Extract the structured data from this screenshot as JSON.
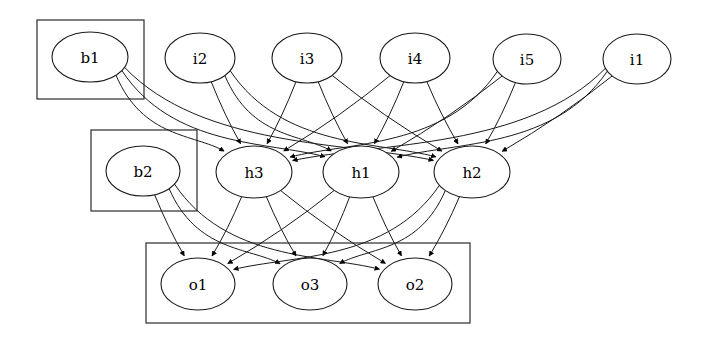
{
  "diagram": {
    "background_color": "#ffffff",
    "stroke_color": "#1a1a1a",
    "label_color": "#000000",
    "width": 711,
    "height": 342
  },
  "clusters": [
    {
      "id": "cluster_b1",
      "label": "",
      "x": 37,
      "y": 20,
      "w": 107,
      "h": 79
    },
    {
      "id": "cluster_b2",
      "label": "",
      "x": 91,
      "y": 130,
      "w": 106,
      "h": 81
    },
    {
      "id": "cluster_out",
      "label": "",
      "x": 146,
      "y": 243,
      "w": 324,
      "h": 80
    }
  ],
  "nodes": [
    {
      "id": "b1",
      "label": "b1",
      "cx": 90,
      "cy": 57,
      "rx": 38,
      "ry": 25,
      "layer": "bias-input"
    },
    {
      "id": "i2",
      "label": "i2",
      "cx": 200,
      "cy": 58,
      "rx": 35,
      "ry": 25,
      "layer": "input"
    },
    {
      "id": "i3",
      "label": "i3",
      "cx": 307,
      "cy": 58,
      "rx": 35,
      "ry": 25,
      "layer": "input"
    },
    {
      "id": "i4",
      "label": "i4",
      "cx": 415,
      "cy": 58,
      "rx": 35,
      "ry": 25,
      "layer": "input"
    },
    {
      "id": "i5",
      "label": "i5",
      "cx": 527,
      "cy": 59,
      "rx": 34,
      "ry": 25,
      "layer": "input"
    },
    {
      "id": "i1",
      "label": "i1",
      "cx": 637,
      "cy": 59,
      "rx": 34,
      "ry": 25,
      "layer": "input"
    },
    {
      "id": "b2",
      "label": "b2",
      "cx": 143,
      "cy": 171,
      "rx": 37,
      "ry": 25,
      "layer": "bias-hidden"
    },
    {
      "id": "h3",
      "label": "h3",
      "cx": 254,
      "cy": 172,
      "rx": 38,
      "ry": 26,
      "layer": "hidden"
    },
    {
      "id": "h1",
      "label": "h1",
      "cx": 361,
      "cy": 172,
      "rx": 38,
      "ry": 26,
      "layer": "hidden"
    },
    {
      "id": "h2",
      "label": "h2",
      "cx": 472,
      "cy": 172,
      "rx": 38,
      "ry": 26,
      "layer": "hidden"
    },
    {
      "id": "o1",
      "label": "o1",
      "cx": 198,
      "cy": 284,
      "rx": 37,
      "ry": 26,
      "layer": "output"
    },
    {
      "id": "o3",
      "label": "o3",
      "cx": 310,
      "cy": 284,
      "rx": 37,
      "ry": 26,
      "layer": "output"
    },
    {
      "id": "o2",
      "label": "o2",
      "cx": 415,
      "cy": 284,
      "rx": 37,
      "ry": 26,
      "layer": "output"
    }
  ],
  "edges": [
    {
      "from": "b1",
      "to": "h3",
      "curved": true
    },
    {
      "from": "b1",
      "to": "h1",
      "curved": true
    },
    {
      "from": "b1",
      "to": "h2",
      "curved": true
    },
    {
      "from": "i2",
      "to": "h3",
      "curved": false
    },
    {
      "from": "i2",
      "to": "h1",
      "curved": true
    },
    {
      "from": "i2",
      "to": "h2",
      "curved": true
    },
    {
      "from": "i3",
      "to": "h3",
      "curved": false
    },
    {
      "from": "i3",
      "to": "h1",
      "curved": false
    },
    {
      "from": "i3",
      "to": "h2",
      "curved": false
    },
    {
      "from": "i4",
      "to": "h3",
      "curved": false
    },
    {
      "from": "i4",
      "to": "h1",
      "curved": false
    },
    {
      "from": "i4",
      "to": "h2",
      "curved": false
    },
    {
      "from": "i5",
      "to": "h3",
      "curved": true
    },
    {
      "from": "i5",
      "to": "h1",
      "curved": false
    },
    {
      "from": "i5",
      "to": "h2",
      "curved": false
    },
    {
      "from": "i1",
      "to": "h3",
      "curved": true
    },
    {
      "from": "i1",
      "to": "h1",
      "curved": true
    },
    {
      "from": "i1",
      "to": "h2",
      "curved": false
    },
    {
      "from": "b2",
      "to": "o1",
      "curved": false
    },
    {
      "from": "b2",
      "to": "o3",
      "curved": true
    },
    {
      "from": "b2",
      "to": "o2",
      "curved": true
    },
    {
      "from": "h3",
      "to": "o1",
      "curved": false
    },
    {
      "from": "h3",
      "to": "o3",
      "curved": false
    },
    {
      "from": "h3",
      "to": "o2",
      "curved": false
    },
    {
      "from": "h1",
      "to": "o1",
      "curved": false
    },
    {
      "from": "h1",
      "to": "o3",
      "curved": false
    },
    {
      "from": "h1",
      "to": "o2",
      "curved": false
    },
    {
      "from": "h2",
      "to": "o1",
      "curved": true
    },
    {
      "from": "h2",
      "to": "o3",
      "curved": true
    },
    {
      "from": "h2",
      "to": "o2",
      "curved": false
    }
  ],
  "chart_data": {
    "type": "diagram",
    "layers": [
      {
        "name": "input",
        "nodes": [
          "i2",
          "i3",
          "i4",
          "i5",
          "i1"
        ]
      },
      {
        "name": "bias-input",
        "nodes": [
          "b1"
        ]
      },
      {
        "name": "hidden",
        "nodes": [
          "h3",
          "h1",
          "h2"
        ]
      },
      {
        "name": "bias-hidden",
        "nodes": [
          "b2"
        ]
      },
      {
        "name": "output",
        "nodes": [
          "o1",
          "o3",
          "o2"
        ]
      }
    ],
    "edge_count": 30,
    "node_count": 13,
    "directed": true
  }
}
